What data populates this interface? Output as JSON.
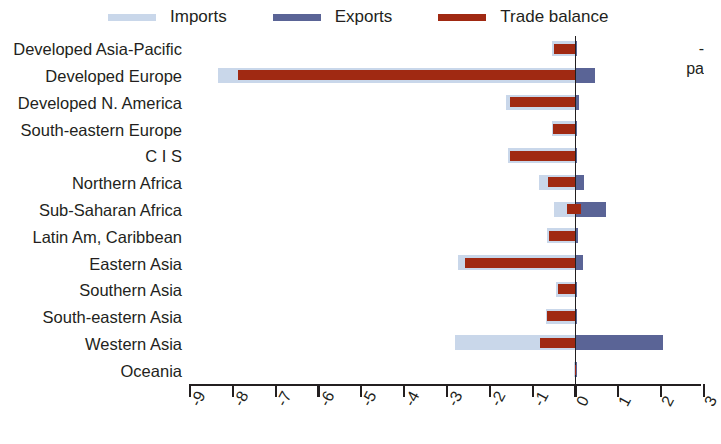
{
  "legend": {
    "items": [
      {
        "label": "Imports",
        "color": "#c9d7ea",
        "name": "legend-imports"
      },
      {
        "label": "Exports",
        "color": "#5a6496",
        "name": "legend-exports"
      },
      {
        "label": "Trade balance",
        "color": "#a02912",
        "name": "legend-trade-balance"
      }
    ]
  },
  "edge_note": {
    "line1": "-",
    "line2": "pa"
  },
  "chart_data": {
    "type": "bar",
    "orientation": "horizontal",
    "title": "",
    "xlabel": "",
    "ylabel": "",
    "xlim": [
      -9,
      3
    ],
    "xticks": [
      -9,
      -8,
      -7,
      -6,
      -5,
      -4,
      -3,
      -2,
      -1,
      0,
      1,
      2,
      3
    ],
    "xtick_labels": [
      "-9",
      "-8",
      "-7",
      "-6",
      "-5",
      "-4",
      "-3",
      "-2",
      "-1",
      "0",
      "1",
      "2",
      "3"
    ],
    "grid": false,
    "legend_position": "top",
    "categories": [
      "Developed Asia-Pacific",
      "Developed Europe",
      "Developed N. America",
      "South-eastern Europe",
      "C I S",
      "Northern Africa",
      "Sub-Saharan Africa",
      "Latin Am, Caribbean",
      "Eastern Asia",
      "Southern Asia",
      "South-eastern Asia",
      "Western Asia",
      "Oceania"
    ],
    "series": [
      {
        "name": "Imports",
        "color": "#c9d7ea",
        "values": [
          -0.55,
          -8.35,
          -1.62,
          -0.56,
          -1.58,
          -0.86,
          -0.5,
          -0.66,
          -2.75,
          -0.45,
          -0.7,
          -2.82,
          -0.04
        ]
      },
      {
        "name": "Exports",
        "color": "#5a6496",
        "values": [
          0.04,
          0.46,
          0.08,
          0.03,
          0.04,
          0.21,
          0.72,
          0.05,
          0.17,
          0.03,
          0.03,
          2.05,
          0.02
        ]
      },
      {
        "name": "Trade balance",
        "color": "#a02912",
        "values": [
          -0.51,
          -7.89,
          -1.54,
          -0.53,
          -1.54,
          -0.65,
          -0.2,
          -0.61,
          -2.58,
          -0.42,
          -0.67,
          -0.84,
          -0.02
        ]
      }
    ],
    "balance_positive_extent": [
      0,
      0,
      0,
      0,
      0,
      0,
      0.12,
      0,
      0,
      0,
      0,
      0,
      0
    ]
  }
}
